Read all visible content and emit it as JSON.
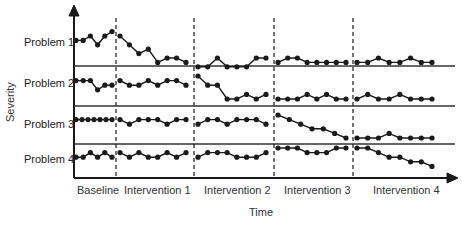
{
  "chart_data": {
    "type": "line",
    "title": "",
    "xlabel": "Time",
    "ylabel": "Severity",
    "layout": "multiple-baseline design, 4 stacked panels",
    "phases": [
      "Baseline",
      "Intervention 1",
      "Intervention 2",
      "Intervention 3",
      "Intervention 4"
    ],
    "rows": [
      "Problem 1",
      "Problem 2",
      "Problem 3",
      "Problem 4"
    ],
    "grid": false,
    "legend": "none",
    "series": [
      {
        "name": "Problem 1",
        "segments": [
          {
            "phase": "Baseline",
            "values": [
              4,
              4,
              5,
              3,
              5,
              6
            ]
          },
          {
            "phase": "Intervention 1",
            "values": [
              5,
              3,
              1,
              2,
              -1,
              0,
              0,
              -1
            ]
          },
          {
            "phase": "Intervention 2",
            "values": [
              -2,
              -2,
              0,
              -2,
              -2,
              -2,
              0,
              0
            ]
          },
          {
            "phase": "Intervention 3",
            "values": [
              -1,
              0,
              0,
              -1,
              -1,
              -1,
              -1,
              -1
            ]
          },
          {
            "phase": "Intervention 4",
            "values": [
              -1,
              -1,
              0,
              -1,
              -1,
              0,
              -1,
              -1
            ]
          }
        ]
      },
      {
        "name": "Problem 2",
        "segments": [
          {
            "phase": "Baseline",
            "values": [
              4,
              4,
              4,
              2,
              3,
              3
            ]
          },
          {
            "phase": "Intervention 1",
            "values": [
              4,
              3,
              3,
              4,
              3,
              4,
              4,
              3
            ]
          },
          {
            "phase": "Intervention 2",
            "values": [
              5,
              3,
              3,
              0,
              0,
              1,
              0,
              1
            ]
          },
          {
            "phase": "Intervention 3",
            "values": [
              0,
              0,
              0,
              1,
              0,
              1,
              0,
              0
            ]
          },
          {
            "phase": "Intervention 4",
            "values": [
              0,
              1,
              0,
              0,
              1,
              0,
              0,
              0
            ]
          }
        ]
      },
      {
        "name": "Problem 3",
        "segments": [
          {
            "phase": "Baseline",
            "values": [
              4,
              4,
              4,
              4,
              4,
              4,
              4
            ]
          },
          {
            "phase": "Intervention 1",
            "values": [
              4,
              3,
              4,
              4,
              4,
              3,
              4,
              4
            ]
          },
          {
            "phase": "Intervention 2",
            "values": [
              3,
              4,
              4,
              3,
              4,
              4,
              4,
              3
            ]
          },
          {
            "phase": "Intervention 3",
            "values": [
              5,
              4,
              3,
              2,
              2,
              1,
              0
            ]
          },
          {
            "phase": "Intervention 4",
            "values": [
              0,
              0,
              0,
              1,
              0,
              0,
              0,
              0
            ]
          }
        ]
      },
      {
        "name": "Problem 4",
        "segments": [
          {
            "phase": "Baseline",
            "values": [
              3,
              3,
              4,
              3,
              4,
              3
            ]
          },
          {
            "phase": "Intervention 1",
            "values": [
              4,
              3,
              4,
              3,
              3,
              4,
              3,
              4
            ]
          },
          {
            "phase": "Intervention 2",
            "values": [
              3,
              4,
              4,
              4,
              3,
              3,
              3,
              4
            ]
          },
          {
            "phase": "Intervention 3",
            "values": [
              5,
              5,
              5,
              4,
              4,
              4,
              5,
              5
            ]
          },
          {
            "phase": "Intervention 4",
            "values": [
              5,
              5,
              4,
              3,
              3,
              2,
              2,
              1
            ]
          }
        ]
      }
    ]
  },
  "labels": {
    "rows": [
      "Problem 1",
      "Problem 2",
      "Problem 3",
      "Problem 4"
    ],
    "phases": [
      "Baseline",
      "Intervention 1",
      "Intervention 2",
      "Intervention 3",
      "Intervention 4"
    ],
    "xlabel": "Time",
    "ylabel": "Severity"
  },
  "colors": {
    "ink": "#1a1a1a",
    "background": "#ffffff"
  }
}
